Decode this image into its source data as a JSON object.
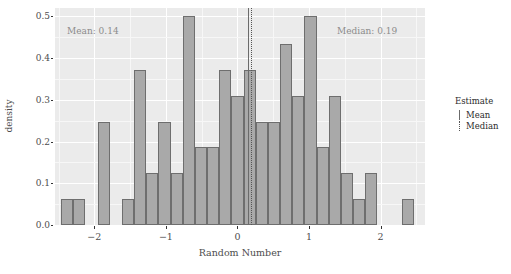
{
  "chart_data": {
    "type": "bar",
    "title": "",
    "xlabel": "Random Number",
    "ylabel": "density",
    "xlim": [
      -2.55,
      2.62
    ],
    "ylim": [
      0.0,
      0.52
    ],
    "grid": true,
    "bin_width": 0.17,
    "x_ticks": [
      -2,
      -1,
      0,
      1,
      2
    ],
    "x_tick_labels": [
      "−2",
      "−1",
      "0",
      "1",
      "2"
    ],
    "y_ticks": [
      0.0,
      0.1,
      0.2,
      0.3,
      0.4,
      0.5
    ],
    "y_tick_labels": [
      "0.0",
      "0.1",
      "0.2",
      "0.3",
      "0.4",
      "0.5"
    ],
    "bin_centers": [
      -2.38,
      -2.21,
      -2.04,
      -1.87,
      -1.7,
      -1.53,
      -1.36,
      -1.19,
      -1.02,
      -0.85,
      -0.68,
      -0.51,
      -0.34,
      -0.17,
      0.0,
      0.17,
      0.34,
      0.51,
      0.68,
      0.85,
      1.02,
      1.19,
      1.36,
      1.53,
      1.7,
      1.87,
      2.04,
      2.21,
      2.38
    ],
    "values": [
      0.062,
      0.062,
      0.0,
      0.248,
      0.0,
      0.062,
      0.372,
      0.124,
      0.248,
      0.124,
      0.5,
      0.186,
      0.186,
      0.372,
      0.31,
      0.372,
      0.248,
      0.248,
      0.434,
      0.31,
      0.5,
      0.186,
      0.31,
      0.124,
      0.062,
      0.124,
      0.0,
      0.0,
      0.062
    ],
    "bar_fill": "#a9a9a9",
    "bar_border": "#6e6e6e",
    "panel_background": "#ebebeb",
    "annotations": [
      {
        "name": "mean-annotation",
        "text": "Mean: 0.14",
        "x": 0.14
      },
      {
        "name": "median-annotation",
        "text": "Median: 0.19",
        "x": 0.19
      }
    ],
    "reference_lines": [
      {
        "name": "mean-line",
        "label": "Mean",
        "value": 0.14,
        "style": "solid"
      },
      {
        "name": "median-line",
        "label": "Median",
        "value": 0.19,
        "style": "dotted"
      }
    ],
    "legend": {
      "position": "right",
      "title": "Estimate",
      "entries": [
        {
          "label": "Mean",
          "style": "solid"
        },
        {
          "label": "Median",
          "style": "dotted"
        }
      ]
    }
  },
  "caption": ""
}
